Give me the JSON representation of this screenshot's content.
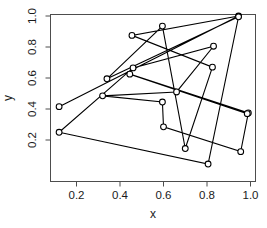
{
  "chart_data": {
    "type": "line",
    "title": "",
    "subtitle": "",
    "xlabel": "x",
    "ylabel": "y",
    "xlim": [
      0.08,
      1.03
    ],
    "ylim": [
      0.0,
      1.03
    ],
    "grid": false,
    "legend": null,
    "marker": "open-circle",
    "line_style": "solid",
    "line_color": "#000000",
    "point_fill": "#ffffff",
    "point_stroke": "#000000",
    "xticks": [
      0.2,
      0.4,
      0.6,
      0.8,
      1.0
    ],
    "xticklabels": [
      "0.2",
      "0.4",
      "0.6",
      "0.8",
      "1.0"
    ],
    "yticks": [
      0.2,
      0.4,
      0.6,
      0.8,
      1.0
    ],
    "yticklabels": [
      "0.2",
      "0.4",
      "0.6",
      "0.8",
      "1.0"
    ],
    "x": [
      0.12,
      0.945,
      0.455,
      0.825,
      0.7,
      0.595,
      0.34,
      0.945,
      0.805,
      0.12,
      0.46,
      0.83,
      0.66,
      0.32,
      0.595,
      0.6,
      0.955,
      0.99,
      0.445,
      0.985
    ],
    "y": [
      0.415,
      1.0,
      0.875,
      0.67,
      0.145,
      0.935,
      0.595,
      0.995,
      0.045,
      0.25,
      0.665,
      0.805,
      0.51,
      0.485,
      0.445,
      0.285,
      0.125,
      0.375,
      0.625,
      0.37
    ],
    "points": [
      {
        "x": 0.12,
        "y": 0.415
      },
      {
        "x": 0.945,
        "y": 1.0
      },
      {
        "x": 0.455,
        "y": 0.875
      },
      {
        "x": 0.825,
        "y": 0.67
      },
      {
        "x": 0.7,
        "y": 0.145
      },
      {
        "x": 0.595,
        "y": 0.935
      },
      {
        "x": 0.34,
        "y": 0.595
      },
      {
        "x": 0.945,
        "y": 0.995
      },
      {
        "x": 0.805,
        "y": 0.045
      },
      {
        "x": 0.12,
        "y": 0.25
      },
      {
        "x": 0.46,
        "y": 0.665
      },
      {
        "x": 0.83,
        "y": 0.805
      },
      {
        "x": 0.66,
        "y": 0.51
      },
      {
        "x": 0.32,
        "y": 0.485
      },
      {
        "x": 0.595,
        "y": 0.445
      },
      {
        "x": 0.6,
        "y": 0.285
      },
      {
        "x": 0.955,
        "y": 0.125
      },
      {
        "x": 0.99,
        "y": 0.375
      },
      {
        "x": 0.445,
        "y": 0.625
      },
      {
        "x": 0.985,
        "y": 0.37
      }
    ]
  }
}
